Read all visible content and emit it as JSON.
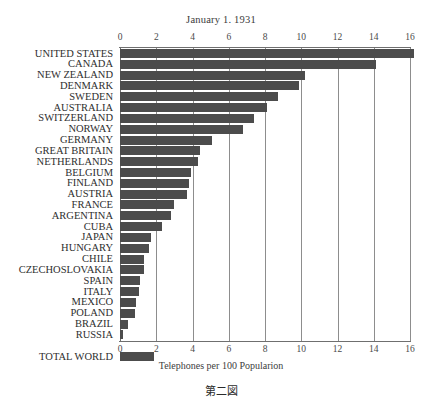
{
  "chart_data": {
    "type": "bar",
    "orientation": "horizontal",
    "title": "January 1. 1931",
    "xlabel": "Telephones per 100 Popularion",
    "ylabel": "",
    "caption": "第二図",
    "xlim": [
      0,
      16.5
    ],
    "xticks": [
      0,
      2,
      4,
      6,
      8,
      10,
      12,
      14,
      16
    ],
    "xtick_labels": [
      "0",
      "2",
      "4",
      "6",
      "8",
      "10",
      "12",
      "14",
      "16"
    ],
    "grid": true,
    "grid_axis": "x",
    "legend": "none",
    "bar_color": "#4c4c4c",
    "axis_color": "#6f6f6f",
    "categories": [
      "UNITED STATES",
      "CANADA",
      "NEW ZEALAND",
      "DENMARK",
      "SWEDEN",
      "AUSTRALIA",
      "SWITZERLAND",
      "NORWAY",
      "GERMANY",
      "GREAT BRITAIN",
      "NETHERLANDS",
      "BELGIUM",
      "FINLAND",
      "AUSTRIA",
      "FRANCE",
      "ARGENTINA",
      "CUBA",
      "JAPAN",
      "HUNGARY",
      "CHILE",
      "CZECHOSLOVAKIA",
      "SPAIN",
      "ITALY",
      "MEXICO",
      "POLAND",
      "BRAZIL",
      "RUSSIA",
      "TOTAL WORLD"
    ],
    "values": [
      16.2,
      14.1,
      10.2,
      9.9,
      8.7,
      8.1,
      7.4,
      6.8,
      5.1,
      4.4,
      4.3,
      3.9,
      3.8,
      3.7,
      3.0,
      2.8,
      2.3,
      1.7,
      1.6,
      1.35,
      1.3,
      1.1,
      1.05,
      0.9,
      0.85,
      0.45,
      0.15,
      1.9
    ],
    "separated_last": true,
    "separated_note": "TOTAL WORLD is plotted after a gap below the country rows"
  }
}
